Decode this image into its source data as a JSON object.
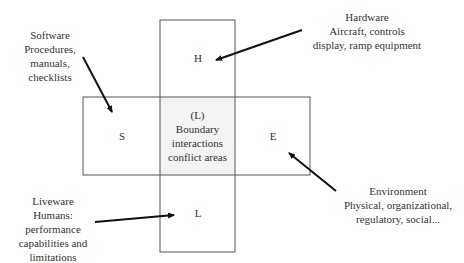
{
  "diagram": {
    "boxes": {
      "hardware": {
        "letter": "H"
      },
      "software": {
        "letter": "S"
      },
      "environment": {
        "letter": "E"
      },
      "liveware": {
        "letter": "L"
      },
      "center": {
        "lines": [
          "(L)",
          "Boundary",
          "interactions",
          "conflict areas"
        ],
        "fill": "#f3f3f3"
      }
    },
    "labels": {
      "software": [
        "Software",
        "Procedures,",
        "manuals,",
        "checklists"
      ],
      "hardware": [
        "Hardware",
        "Aircraft, controls",
        "display, ramp equipment"
      ],
      "liveware": [
        "Liveware",
        "Humans:",
        "performance",
        "capabilities and",
        "limitations"
      ],
      "environment": [
        "Environment",
        "Physical, organizational,",
        "regulatory, social..."
      ]
    },
    "colors": {
      "stroke": "#444444",
      "arrow": "#111111",
      "text": "#333333"
    }
  }
}
